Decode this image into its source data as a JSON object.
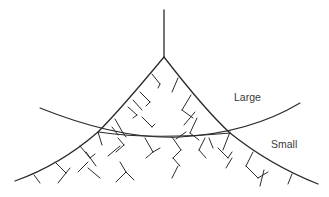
{
  "diagram": {
    "labels": {
      "large": "Large",
      "small": "Small"
    },
    "colors": {
      "line": "#2b2b2b",
      "text": "#3a3a3a",
      "background": "#ffffff"
    }
  }
}
